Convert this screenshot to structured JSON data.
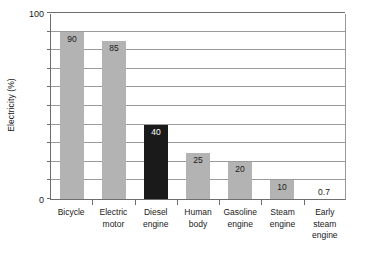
{
  "chart_data": {
    "type": "bar",
    "title": "",
    "xlabel": "",
    "ylabel": "Electricity (%)",
    "ylim": [
      0,
      100
    ],
    "grid": true,
    "legend": "none",
    "y_ticks": [
      0,
      10,
      20,
      30,
      40,
      50,
      60,
      70,
      80,
      90,
      100
    ],
    "y_tick_labels": [
      "0",
      "100"
    ],
    "y_labeled_ticks": [
      0,
      100
    ],
    "categories": [
      "Bicycle",
      "Electric motor",
      "Diesel engine",
      "Human body",
      "Gasoline engine",
      "Steam engine",
      "Early steam engine"
    ],
    "category_lines": [
      [
        "Bicycle"
      ],
      [
        "Electric",
        "motor"
      ],
      [
        "Diesel",
        "engine"
      ],
      [
        "Human",
        "body"
      ],
      [
        "Gasoline",
        "engine"
      ],
      [
        "Steam",
        "engine"
      ],
      [
        "Early",
        "steam",
        "engine"
      ]
    ],
    "values": [
      90,
      85,
      40,
      25,
      20,
      10,
      0.7
    ],
    "value_labels": [
      "90",
      "85",
      "40",
      "25",
      "20",
      "10",
      "0.7"
    ],
    "bar_colors": [
      "#b3b3b3",
      "#b3b3b3",
      "#1a1a1a",
      "#b3b3b3",
      "#b3b3b3",
      "#b3b3b3",
      "#b3b3b3"
    ],
    "label_colors": [
      "#1a1a1a",
      "#1a1a1a",
      "#ffffff",
      "#1a1a1a",
      "#1a1a1a",
      "#1a1a1a",
      "#1a1a1a"
    ]
  },
  "style": {
    "background": "#ffffff",
    "grid_color": "#9a9a9a",
    "axis_color": "#6e6e6e",
    "text_color": "#1a1a1a",
    "bar_gray": "#b3b3b3",
    "bar_dark": "#1a1a1a"
  }
}
